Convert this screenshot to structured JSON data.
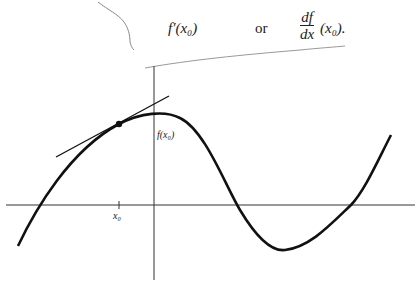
{
  "formula": {
    "derivative_prime": "f′(x₀)",
    "connector": "or",
    "leibniz_numerator": "df",
    "leibniz_denominator": "dx",
    "leibniz_argument": "(x₀)."
  },
  "graph": {
    "point_label": "x₀",
    "value_label": "f(x₀)",
    "description": "Graph of a function with tangent line drawn at point (x0, f(x0))"
  },
  "colors": {
    "ink": "#1a1a1a",
    "axis": "#333333",
    "scribble": "#888888"
  }
}
